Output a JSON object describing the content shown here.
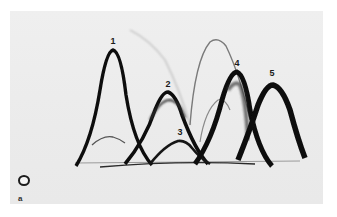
{
  "figure": {
    "panel_label": "a",
    "peaks": [
      {
        "label": "1",
        "x": 113,
        "y": 41
      },
      {
        "label": "2",
        "x": 168,
        "y": 84
      },
      {
        "label": "3",
        "x": 180,
        "y": 132
      },
      {
        "label": "4",
        "x": 237,
        "y": 63
      },
      {
        "label": "5",
        "x": 272,
        "y": 73
      }
    ],
    "well_symbol": "application-well",
    "colors": {
      "background": "#ebebeb",
      "arc": "#151515",
      "faint_arc": "#8a8a8a",
      "border": "#ffffff"
    }
  }
}
